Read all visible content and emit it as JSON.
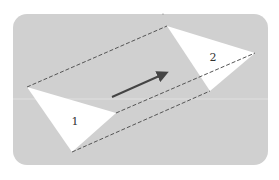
{
  "diagram": {
    "type": "translation",
    "background": {
      "color": "#d0d0d0",
      "x": 13,
      "y": 14,
      "width": 255,
      "height": 151,
      "radius": 14
    },
    "shapes": [
      {
        "id": "triangle-1",
        "label": "1",
        "fill": "#ffffff",
        "points": [
          [
            27,
            87
          ],
          [
            116,
            113
          ],
          [
            72,
            152
          ]
        ],
        "label_pos": [
          75,
          125
        ]
      },
      {
        "id": "triangle-2",
        "label": "2",
        "fill": "#ffffff",
        "points": [
          [
            167,
            26
          ],
          [
            255,
            53
          ],
          [
            210,
            91
          ]
        ],
        "label_pos": [
          213,
          61
        ]
      }
    ],
    "guide_lines": {
      "style": "dashed",
      "color": "#555555",
      "lines": [
        [
          [
            27,
            87
          ],
          [
            167,
            26
          ]
        ],
        [
          [
            116,
            113
          ],
          [
            255,
            53
          ]
        ],
        [
          [
            72,
            152
          ],
          [
            210,
            91
          ]
        ]
      ]
    },
    "arrow": {
      "from": [
        112,
        97
      ],
      "to": [
        168,
        72
      ],
      "color": "#444444"
    },
    "labels": {
      "shape1": "1",
      "shape2": "2"
    }
  }
}
